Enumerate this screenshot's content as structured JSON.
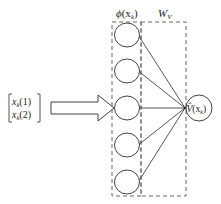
{
  "diagram": {
    "type": "neural-network-critic",
    "input": {
      "label_row1": "x",
      "label_row1_sub": "k",
      "label_row1_arg": "(1)",
      "label_row2": "x",
      "label_row2_sub": "k",
      "label_row2_arg": "(2)"
    },
    "hidden_layer": {
      "title_func": "ϕ",
      "title_arg": "(x",
      "title_sub": "k",
      "title_close": ")",
      "node_count": 5
    },
    "weights": {
      "title": "W",
      "title_sub": "V"
    },
    "output": {
      "label": "V̂",
      "label_arg": "(x",
      "label_sub": "k",
      "label_close": ")"
    },
    "colors": {
      "stroke": "#444444",
      "dash": "#666666",
      "background": "#ffffff"
    }
  }
}
